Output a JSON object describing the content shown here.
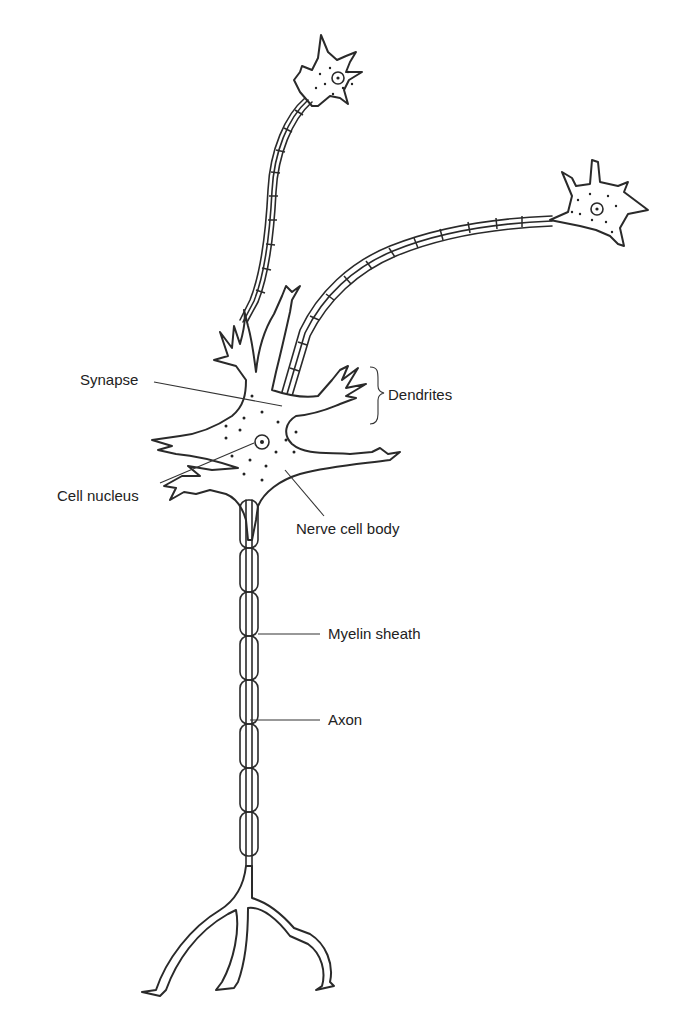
{
  "figure": {
    "type": "neuron diagram",
    "labels": {
      "synapse": "Synapse",
      "dendrites": "Dendrites",
      "cell_nucleus": "Cell nucleus",
      "nerve_cell_body": "Nerve cell body",
      "myelin_sheath": "Myelin sheath",
      "axon": "Axon"
    },
    "colors": {
      "line": "#2a2a2a",
      "background": "#ffffff"
    }
  }
}
